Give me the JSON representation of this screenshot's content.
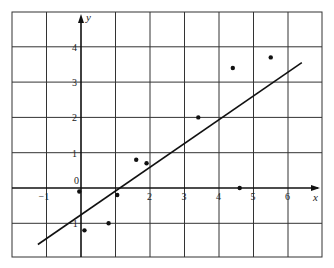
{
  "chart_data": {
    "type": "scatter",
    "title": "",
    "xlabel": "x",
    "ylabel": "y",
    "xlim": [
      -1.9,
      7.1
    ],
    "ylim": [
      -2.0,
      5.0
    ],
    "grid": true,
    "x_ticks": [
      "-1",
      "2",
      "3",
      "4",
      "5",
      "6"
    ],
    "y_ticks": [
      "0",
      "-1",
      "1",
      "2",
      "3",
      "4"
    ],
    "series": [
      {
        "name": "observations",
        "type": "scatter",
        "x": [
          -0.05,
          0.1,
          0.8,
          1.05,
          1.6,
          1.9,
          3.4,
          4.4,
          4.6,
          5.5
        ],
        "y": [
          -0.1,
          -1.2,
          -1.0,
          -0.2,
          0.8,
          0.7,
          2.0,
          3.4,
          0.0,
          3.7
        ]
      },
      {
        "name": "fitted line",
        "type": "line",
        "x": [
          -1.25,
          6.4
        ],
        "y": [
          -1.6,
          3.55
        ]
      }
    ],
    "legend": null
  }
}
